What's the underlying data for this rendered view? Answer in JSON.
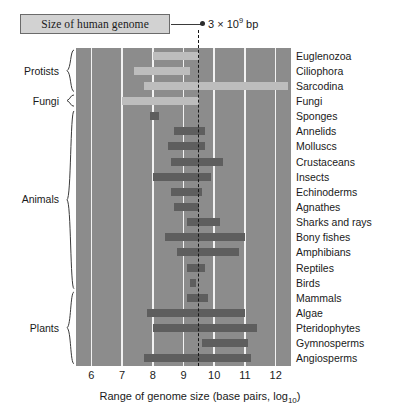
{
  "callout": {
    "box_label": "Size of human genome",
    "value_text": "3 × 10",
    "value_exponent": "9",
    "value_unit": " bp",
    "reference_log10": 9.5
  },
  "axis": {
    "title_main": "Range of genome size (base pairs, log",
    "title_sub": "10",
    "title_end": ")",
    "ticks": [
      "6",
      "7",
      "8",
      "9",
      "10",
      "11",
      "12"
    ],
    "min": 5.5,
    "max": 12.5
  },
  "groups": [
    {
      "label": "Protists",
      "start_index": 0,
      "end_index": 2
    },
    {
      "label": "Fungi",
      "start_index": 3,
      "end_index": 3
    },
    {
      "label": "Animals",
      "start_index": 4,
      "end_index": 15
    },
    {
      "label": "Plants",
      "start_index": 16,
      "end_index": 20
    }
  ],
  "colors": {
    "plot_background": "#8c8c8c",
    "gridline": "#f2f2f2",
    "bar_light": "#bdbdbd",
    "bar_dark": "#5e5e5e",
    "reference_line": "#161616",
    "callout_fill": "#d2d2d2"
  },
  "chart_data": {
    "type": "bar",
    "orientation": "horizontal",
    "subtype": "range-span",
    "title": "",
    "xlabel": "Range of genome size (base pairs, log10)",
    "ylabel": "",
    "xlim": [
      5.5,
      12.5
    ],
    "xticks": [
      6,
      7,
      8,
      9,
      10,
      11,
      12
    ],
    "grid": true,
    "legend": false,
    "annotations": [
      {
        "text": "Size of human genome = 3 × 10^9 bp",
        "x": 9.5,
        "type": "vertical-dashed-line"
      }
    ],
    "categories": [
      "Euglenozoa",
      "Ciliophora",
      "Sarcodina",
      "Fungi",
      "Sponges",
      "Annelids",
      "Molluscs",
      "Crustaceans",
      "Insects",
      "Echinoderms",
      "Agnathes",
      "Sharks and rays",
      "Bony fishes",
      "Amphibians",
      "Reptiles",
      "Birds",
      "Mammals",
      "Algae",
      "Pteridophytes",
      "Gymnosperms",
      "Angiosperms"
    ],
    "ranges": [
      {
        "category": "Euglenozoa",
        "group": "Protists",
        "xmin": 8.0,
        "xmax": 9.5,
        "shade": "light"
      },
      {
        "category": "Ciliophora",
        "group": "Protists",
        "xmin": 7.4,
        "xmax": 9.2,
        "shade": "light"
      },
      {
        "category": "Sarcodina",
        "group": "Protists",
        "xmin": 7.7,
        "xmax": 12.4,
        "shade": "light"
      },
      {
        "category": "Fungi",
        "group": "Fungi",
        "xmin": 7.0,
        "xmax": 9.5,
        "shade": "light"
      },
      {
        "category": "Sponges",
        "group": "Animals",
        "xmin": 7.9,
        "xmax": 8.2,
        "shade": "dark"
      },
      {
        "category": "Annelids",
        "group": "Animals",
        "xmin": 8.7,
        "xmax": 9.7,
        "shade": "dark"
      },
      {
        "category": "Molluscs",
        "group": "Animals",
        "xmin": 8.5,
        "xmax": 9.7,
        "shade": "dark"
      },
      {
        "category": "Crustaceans",
        "group": "Animals",
        "xmin": 8.6,
        "xmax": 10.3,
        "shade": "dark"
      },
      {
        "category": "Insects",
        "group": "Animals",
        "xmin": 8.0,
        "xmax": 9.9,
        "shade": "dark"
      },
      {
        "category": "Echinoderms",
        "group": "Animals",
        "xmin": 8.6,
        "xmax": 9.6,
        "shade": "dark"
      },
      {
        "category": "Agnathes",
        "group": "Animals",
        "xmin": 8.7,
        "xmax": 9.5,
        "shade": "dark"
      },
      {
        "category": "Sharks and rays",
        "group": "Animals",
        "xmin": 9.1,
        "xmax": 10.2,
        "shade": "dark"
      },
      {
        "category": "Bony fishes",
        "group": "Animals",
        "xmin": 8.4,
        "xmax": 11.0,
        "shade": "dark"
      },
      {
        "category": "Amphibians",
        "group": "Animals",
        "xmin": 8.8,
        "xmax": 10.8,
        "shade": "dark"
      },
      {
        "category": "Reptiles",
        "group": "Animals",
        "xmin": 9.1,
        "xmax": 9.7,
        "shade": "dark"
      },
      {
        "category": "Birds",
        "group": "Animals",
        "xmin": 9.2,
        "xmax": 9.4,
        "shade": "dark"
      },
      {
        "category": "Mammals",
        "group": "Animals",
        "xmin": 9.1,
        "xmax": 9.8,
        "shade": "dark"
      },
      {
        "category": "Algae",
        "group": "Plants",
        "xmin": 7.8,
        "xmax": 11.0,
        "shade": "dark"
      },
      {
        "category": "Pteridophytes",
        "group": "Plants",
        "xmin": 8.0,
        "xmax": 11.4,
        "shade": "dark"
      },
      {
        "category": "Gymnosperms",
        "group": "Plants",
        "xmin": 9.6,
        "xmax": 11.1,
        "shade": "dark"
      },
      {
        "category": "Angiosperms",
        "group": "Plants",
        "xmin": 7.7,
        "xmax": 11.2,
        "shade": "dark"
      }
    ]
  }
}
